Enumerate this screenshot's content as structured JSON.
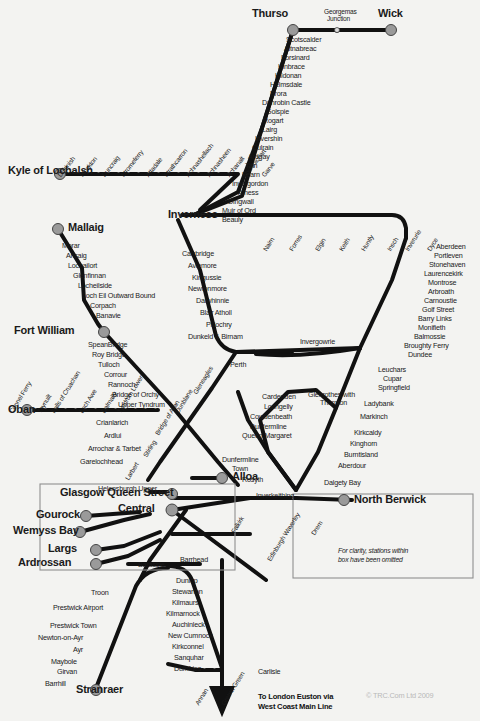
{
  "meta": {
    "copyright": "© TRC.Com Ltd 2009",
    "box_note_line1": "For clarity, stations within",
    "box_note_line2": "box have been omitted",
    "terminus_note_line1": "To London Euston via",
    "terminus_note_line2": "West Coast Main Line",
    "line_color": "#111111",
    "station_dot_color": "#9a9a9a",
    "background": "#f3f3f1"
  },
  "major_stations": [
    {
      "name": "Thurso",
      "x": 276,
      "y": 14
    },
    {
      "name": "Wick",
      "x": 392,
      "y": 14
    },
    {
      "name": "Kyle of Lochalsh",
      "x": 14,
      "y": 173
    },
    {
      "name": "Mallaig",
      "x": 50,
      "y": 222
    },
    {
      "name": "Inverness",
      "x": 168,
      "y": 215
    },
    {
      "name": "Fort William",
      "x": 14,
      "y": 332
    },
    {
      "name": "Oban",
      "x": 12,
      "y": 411
    },
    {
      "name": "Alloa",
      "x": 228,
      "y": 477
    },
    {
      "name": "Glasgow Queen Street",
      "x": 80,
      "y": 494
    },
    {
      "name": "Central",
      "x": 148,
      "y": 508
    },
    {
      "name": "Gourock",
      "x": 56,
      "y": 514
    },
    {
      "name": "Wemyss Bay",
      "x": 44,
      "y": 530
    },
    {
      "name": "Largs",
      "x": 68,
      "y": 548
    },
    {
      "name": "Ardrossan",
      "x": 40,
      "y": 562
    },
    {
      "name": "North Berwick",
      "x": 352,
      "y": 500
    },
    {
      "name": "Stranraer",
      "x": 76,
      "y": 693
    }
  ],
  "labels_horizontal": [
    {
      "t": "Georgemas",
      "x": 324,
      "y": 9,
      "c": "smaller"
    },
    {
      "t": "Junction",
      "x": 327,
      "y": 16,
      "c": "smaller"
    },
    {
      "t": "Scotscalder",
      "x": 286,
      "y": 36,
      "c": "small"
    },
    {
      "t": "Altnabreac",
      "x": 284,
      "y": 45,
      "c": "small"
    },
    {
      "t": "Forsinard",
      "x": 281,
      "y": 54,
      "c": "small"
    },
    {
      "t": "Kinbrace",
      "x": 278,
      "y": 63,
      "c": "small"
    },
    {
      "t": "Kildonan",
      "x": 275,
      "y": 72,
      "c": "small"
    },
    {
      "t": "Helmsdale",
      "x": 270,
      "y": 81,
      "c": "small"
    },
    {
      "t": "Brora",
      "x": 270,
      "y": 90,
      "c": "small"
    },
    {
      "t": "Dunrobin Castle",
      "x": 262,
      "y": 99,
      "c": "small"
    },
    {
      "t": "Golspie",
      "x": 266,
      "y": 108,
      "c": "small"
    },
    {
      "t": "Rogart",
      "x": 263,
      "y": 117,
      "c": "small"
    },
    {
      "t": "Lairg",
      "x": 262,
      "y": 126,
      "c": "small"
    },
    {
      "t": "Invershin",
      "x": 255,
      "y": 135,
      "c": "small"
    },
    {
      "t": "Culrain",
      "x": 252,
      "y": 144,
      "c": "small"
    },
    {
      "t": "Ardgay",
      "x": 248,
      "y": 153,
      "c": "small"
    },
    {
      "t": "Tain",
      "x": 245,
      "y": 162,
      "c": "small"
    },
    {
      "t": "Fearn",
      "x": 242,
      "y": 171,
      "c": "small"
    },
    {
      "t": "Invergordon",
      "x": 232,
      "y": 180,
      "c": "small"
    },
    {
      "t": "Alness",
      "x": 238,
      "y": 189,
      "c": "small"
    },
    {
      "t": "Dingwall",
      "x": 228,
      "y": 198,
      "c": "small"
    },
    {
      "t": "Muir of Ord",
      "x": 222,
      "y": 207,
      "c": "small"
    },
    {
      "t": "Beauly",
      "x": 222,
      "y": 216,
      "c": "small"
    },
    {
      "t": "Morar",
      "x": 62,
      "y": 242,
      "c": "small"
    },
    {
      "t": "Arisaig",
      "x": 66,
      "y": 252,
      "c": "small"
    },
    {
      "t": "Lochailort",
      "x": 68,
      "y": 262,
      "c": "small"
    },
    {
      "t": "Glenfinnan",
      "x": 73,
      "y": 272,
      "c": "small"
    },
    {
      "t": "Locheilside",
      "x": 78,
      "y": 282,
      "c": "small"
    },
    {
      "t": "Loch Eil Outward Bound",
      "x": 82,
      "y": 292,
      "c": "small"
    },
    {
      "t": "Corpach",
      "x": 90,
      "y": 302,
      "c": "small"
    },
    {
      "t": "Banavie",
      "x": 96,
      "y": 312,
      "c": "small"
    },
    {
      "t": "Carrbridge",
      "x": 182,
      "y": 250,
      "c": "small"
    },
    {
      "t": "Aviemore",
      "x": 188,
      "y": 262,
      "c": "small"
    },
    {
      "t": "Kingussie",
      "x": 192,
      "y": 274,
      "c": "small"
    },
    {
      "t": "Newtonmore",
      "x": 188,
      "y": 285,
      "c": "small"
    },
    {
      "t": "Dalwhinnie",
      "x": 196,
      "y": 297,
      "c": "small"
    },
    {
      "t": "Blair Atholl",
      "x": 200,
      "y": 309,
      "c": "small"
    },
    {
      "t": "Pitlochry",
      "x": 206,
      "y": 321,
      "c": "small"
    },
    {
      "t": "Dunkeld & Birnam",
      "x": 188,
      "y": 333,
      "c": "small"
    },
    {
      "t": "Aberdeen",
      "x": 436,
      "y": 243,
      "c": "small"
    },
    {
      "t": "Portleven",
      "x": 434,
      "y": 252,
      "c": "small"
    },
    {
      "t": "Stonehaven",
      "x": 429,
      "y": 261,
      "c": "small"
    },
    {
      "t": "Laurencekirk",
      "x": 424,
      "y": 270,
      "c": "small"
    },
    {
      "t": "Montrose",
      "x": 428,
      "y": 279,
      "c": "small"
    },
    {
      "t": "Arbroath",
      "x": 428,
      "y": 288,
      "c": "small"
    },
    {
      "t": "Carnoustie",
      "x": 424,
      "y": 297,
      "c": "small"
    },
    {
      "t": "Golf Street",
      "x": 422,
      "y": 306,
      "c": "small"
    },
    {
      "t": "Barry Links",
      "x": 418,
      "y": 315,
      "c": "small"
    },
    {
      "t": "Monifieth",
      "x": 418,
      "y": 324,
      "c": "small"
    },
    {
      "t": "Balmossie",
      "x": 414,
      "y": 333,
      "c": "small"
    },
    {
      "t": "Broughty Ferry",
      "x": 404,
      "y": 342,
      "c": "small"
    },
    {
      "t": "Dundee",
      "x": 408,
      "y": 351,
      "c": "small"
    },
    {
      "t": "Invergowrie",
      "x": 300,
      "y": 338,
      "c": "small"
    },
    {
      "t": "SpeanBridge",
      "x": 88,
      "y": 341,
      "c": "small"
    },
    {
      "t": "Roy Bridge",
      "x": 92,
      "y": 351,
      "c": "small"
    },
    {
      "t": "Tulloch",
      "x": 98,
      "y": 361,
      "c": "small"
    },
    {
      "t": "Corrour",
      "x": 104,
      "y": 371,
      "c": "small"
    },
    {
      "t": "Rannoch",
      "x": 108,
      "y": 381,
      "c": "small"
    },
    {
      "t": "Bridge of Orchy",
      "x": 112,
      "y": 391,
      "c": "small"
    },
    {
      "t": "Upper Tyndrum",
      "x": 118,
      "y": 401,
      "c": "small"
    },
    {
      "t": "Crianlarich",
      "x": 96,
      "y": 419,
      "c": "small"
    },
    {
      "t": "Ardlui",
      "x": 104,
      "y": 432,
      "c": "small"
    },
    {
      "t": "Arrochar & Tarbet",
      "x": 88,
      "y": 445,
      "c": "small"
    },
    {
      "t": "Garelochhead",
      "x": 80,
      "y": 458,
      "c": "small"
    },
    {
      "t": "Perth",
      "x": 230,
      "y": 361,
      "c": "small"
    },
    {
      "t": "Leuchars",
      "x": 378,
      "y": 366,
      "c": "small"
    },
    {
      "t": "Cupar",
      "x": 383,
      "y": 375,
      "c": "small"
    },
    {
      "t": "Springfield",
      "x": 378,
      "y": 384,
      "c": "small"
    },
    {
      "t": "Ladybank",
      "x": 364,
      "y": 400,
      "c": "small"
    },
    {
      "t": "Markinch",
      "x": 360,
      "y": 413,
      "c": "small"
    },
    {
      "t": "Kirkcaldy",
      "x": 354,
      "y": 429,
      "c": "small"
    },
    {
      "t": "Kinghorn",
      "x": 350,
      "y": 440,
      "c": "small"
    },
    {
      "t": "Burntisland",
      "x": 344,
      "y": 451,
      "c": "small"
    },
    {
      "t": "Aberdour",
      "x": 338,
      "y": 462,
      "c": "small"
    },
    {
      "t": "Dalgety Bay",
      "x": 324,
      "y": 479,
      "c": "small"
    },
    {
      "t": "Glenrothes with",
      "x": 308,
      "y": 391,
      "c": "small"
    },
    {
      "t": "Thurnton",
      "x": 320,
      "y": 399,
      "c": "small"
    },
    {
      "t": "Cardenden",
      "x": 262,
      "y": 393,
      "c": "small"
    },
    {
      "t": "Lochgelly",
      "x": 264,
      "y": 403,
      "c": "small"
    },
    {
      "t": "Cowdenbeath",
      "x": 250,
      "y": 413,
      "c": "small"
    },
    {
      "t": "Dunfermline",
      "x": 250,
      "y": 423,
      "c": "small"
    },
    {
      "t": "Queen Margaret",
      "x": 242,
      "y": 432,
      "c": "small"
    },
    {
      "t": "Dunfermline",
      "x": 222,
      "y": 456,
      "c": "small"
    },
    {
      "t": "Town",
      "x": 232,
      "y": 465,
      "c": "small"
    },
    {
      "t": "Rosyth",
      "x": 242,
      "y": 476,
      "c": "small"
    },
    {
      "t": "Inverkeithing",
      "x": 256,
      "y": 492,
      "c": "small"
    },
    {
      "t": "Helensburgh Upper",
      "x": 98,
      "y": 485,
      "c": "small"
    },
    {
      "t": "Barrhead",
      "x": 180,
      "y": 556,
      "c": "small"
    },
    {
      "t": "Barassie",
      "x": 138,
      "y": 561,
      "c": "small"
    },
    {
      "t": "Dunlop",
      "x": 176,
      "y": 577,
      "c": "small"
    },
    {
      "t": "Stewarton",
      "x": 172,
      "y": 588,
      "c": "small"
    },
    {
      "t": "Kilmaurs",
      "x": 172,
      "y": 599,
      "c": "small"
    },
    {
      "t": "Kilmarnock",
      "x": 166,
      "y": 610,
      "c": "small"
    },
    {
      "t": "Auchinleck",
      "x": 172,
      "y": 621,
      "c": "small"
    },
    {
      "t": "New Cumnock",
      "x": 168,
      "y": 632,
      "c": "small"
    },
    {
      "t": "Kirkconnel",
      "x": 172,
      "y": 643,
      "c": "small"
    },
    {
      "t": "Sanquhar",
      "x": 174,
      "y": 654,
      "c": "small"
    },
    {
      "t": "Dumfries",
      "x": 174,
      "y": 665,
      "c": "small"
    },
    {
      "t": "Carlisle",
      "x": 258,
      "y": 668,
      "c": "small"
    },
    {
      "t": "Troon",
      "x": 91,
      "y": 589,
      "c": "small"
    },
    {
      "t": "Prestwick Airport",
      "x": 53,
      "y": 604,
      "c": "small"
    },
    {
      "t": "Prestwick Town",
      "x": 50,
      "y": 622,
      "c": "small"
    },
    {
      "t": "Newton-on-Ayr",
      "x": 38,
      "y": 634,
      "c": "small"
    },
    {
      "t": "Ayr",
      "x": 73,
      "y": 646,
      "c": "small"
    },
    {
      "t": "Maybole",
      "x": 51,
      "y": 658,
      "c": "small"
    },
    {
      "t": "Girvan",
      "x": 57,
      "y": 668,
      "c": "small"
    },
    {
      "t": "Barrhill",
      "x": 45,
      "y": 680,
      "c": "small"
    }
  ],
  "labels_rotated": [
    {
      "t": "Duirinish",
      "x": 62,
      "y": 172,
      "r": -52
    },
    {
      "t": "Plockton",
      "x": 84,
      "y": 172,
      "r": -52
    },
    {
      "t": "Duncraig",
      "x": 106,
      "y": 172,
      "r": -52
    },
    {
      "t": "Stromeferry",
      "x": 125,
      "y": 172,
      "r": -52
    },
    {
      "t": "Attadale",
      "x": 150,
      "y": 172,
      "r": -52
    },
    {
      "t": "Strathcarron",
      "x": 168,
      "y": 172,
      "r": -52
    },
    {
      "t": "Achnashellach",
      "x": 190,
      "y": 172,
      "r": -52
    },
    {
      "t": "Achnasheen",
      "x": 211,
      "y": 172,
      "r": -52
    },
    {
      "t": "Achanalt",
      "x": 231,
      "y": 172,
      "r": -52
    },
    {
      "t": "Lochluichart",
      "x": 247,
      "y": 172,
      "r": -52
    },
    {
      "t": "Garve",
      "x": 266,
      "y": 172,
      "r": -52
    },
    {
      "t": "Nairn",
      "x": 268,
      "y": 246,
      "r": -58
    },
    {
      "t": "Forres",
      "x": 294,
      "y": 246,
      "r": -58
    },
    {
      "t": "Elgin",
      "x": 320,
      "y": 246,
      "r": -58
    },
    {
      "t": "Keith",
      "x": 344,
      "y": 246,
      "r": -58
    },
    {
      "t": "Huntly",
      "x": 366,
      "y": 246,
      "r": -58
    },
    {
      "t": "Insch",
      "x": 392,
      "y": 246,
      "r": -58
    },
    {
      "t": "Inverurie",
      "x": 410,
      "y": 246,
      "r": -58
    },
    {
      "t": "Dyce",
      "x": 432,
      "y": 246,
      "r": -58
    },
    {
      "t": "Connel Ferry",
      "x": 14,
      "y": 408,
      "r": -58
    },
    {
      "t": "Taynuilt",
      "x": 42,
      "y": 408,
      "r": -58
    },
    {
      "t": "Falls of Cruachan",
      "x": 56,
      "y": 408,
      "r": -58
    },
    {
      "t": "Loch Awe",
      "x": 84,
      "y": 408,
      "r": -58
    },
    {
      "t": "Dalmally",
      "x": 106,
      "y": 408,
      "r": -58
    },
    {
      "t": "Tyndrum Lower",
      "x": 122,
      "y": 408,
      "r": -58
    },
    {
      "t": "Gleneagles",
      "x": 198,
      "y": 389,
      "r": -58
    },
    {
      "t": "Dunblane",
      "x": 180,
      "y": 408,
      "r": -58
    },
    {
      "t": "Bridge of Allan",
      "x": 160,
      "y": 430,
      "r": -58
    },
    {
      "t": "Stirling",
      "x": 148,
      "y": 452,
      "r": -58
    },
    {
      "t": "Larbert",
      "x": 130,
      "y": 475,
      "r": -58
    },
    {
      "t": "Falkirk",
      "x": 236,
      "y": 528,
      "r": -58
    },
    {
      "t": "Edinburgh Waverley",
      "x": 272,
      "y": 556,
      "r": -58
    },
    {
      "t": "Drem",
      "x": 316,
      "y": 530,
      "r": -58
    },
    {
      "t": "Annan",
      "x": 200,
      "y": 700,
      "r": -58
    },
    {
      "t": "Gretna Green",
      "x": 226,
      "y": 700,
      "r": -58
    }
  ],
  "rail_lines": {
    "far_north_wick_thurso": "Thurso - Georgemas Junction - Wick",
    "far_north_main": "Georgemas Junction south to Inverness",
    "kyle_line": "Kyle of Lochalsh - Garve - Inverness",
    "west_highland_mallaig": "Mallaig - Fort William",
    "west_highland_oban": "Oban - Tyndrum Lower - Crianlarich",
    "highland_main": "Inverness - Perth",
    "aberdeen_inverness": "Inverness - Aberdeen",
    "east_coast": "Aberdeen - Dundee - Edinburgh",
    "fife_circle": "Edinburgh - Fife - Dundee",
    "glasgow_edinburgh": "Glasgow Queen Street - Edinburgh Waverley",
    "ayrshire": "Glasgow Central - Ayr - Stranraer",
    "nith_valley": "Glasgow Central - Kilmarnock - Dumfries - Carlisle",
    "wcml": "Carlisle - London Euston"
  }
}
